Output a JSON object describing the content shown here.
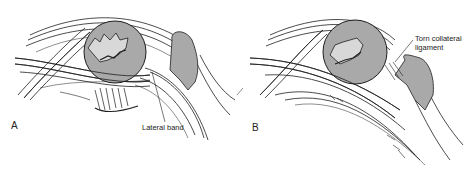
{
  "figure": {
    "panels": [
      {
        "letter": "A",
        "label": "Lateral band"
      },
      {
        "letter": "B",
        "label_line1": "Torn collateral",
        "label_line2": "ligament",
        "signature": "F. Stuft"
      }
    ],
    "colors": {
      "bone_fill": "#a9a9a9",
      "line": "#1e1e1e",
      "background": "#ffffff"
    }
  }
}
